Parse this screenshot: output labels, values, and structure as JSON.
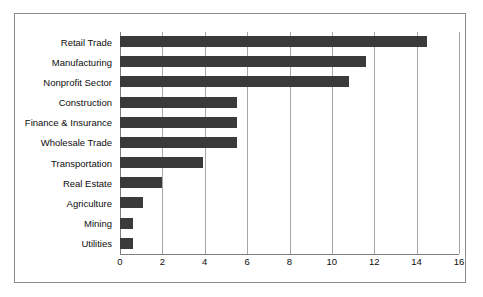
{
  "chart_data": {
    "type": "bar",
    "orientation": "horizontal",
    "title": "",
    "subtitle": "",
    "xlabel": "",
    "ylabel": "",
    "categories": [
      "Retail Trade",
      "Manufacturing",
      "Nonprofit Sector",
      "Construction",
      "Finance & Insurance",
      "Wholesale Trade",
      "Transportation",
      "Real Estate",
      "Agriculture",
      "Mining",
      "Utilities"
    ],
    "values": [
      14.5,
      11.6,
      10.8,
      5.5,
      5.5,
      5.5,
      3.9,
      2.0,
      1.1,
      0.6,
      0.6
    ],
    "xlim": [
      0,
      16
    ],
    "xticks": [
      0,
      2,
      4,
      6,
      8,
      10,
      12,
      14,
      16
    ],
    "xtick_labels": [
      "0",
      "2",
      "4",
      "6",
      "8",
      "10",
      "12",
      "14",
      "16"
    ],
    "grid": "vertical",
    "legend": null,
    "bar_color": "#3a3a3a",
    "gridline_color": "#a6a6a6",
    "axis_color": "#7f7f7f",
    "frame_color": "#8a8a8a",
    "background_color": "#ffffff"
  }
}
